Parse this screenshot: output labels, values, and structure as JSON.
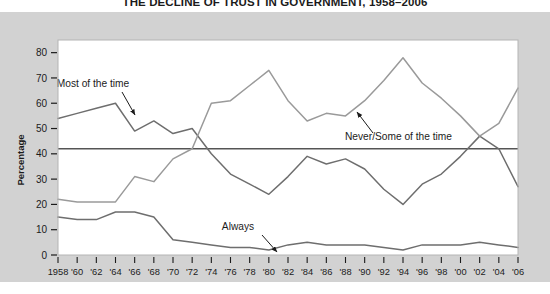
{
  "chart_data": {
    "type": "line",
    "title": "THE DECLINE OF TRUST IN GOVERNMENT, 1958–2006",
    "xlabel": "",
    "ylabel": "Percentage",
    "ylim": [
      0,
      85
    ],
    "yticks": [
      0,
      10,
      20,
      30,
      40,
      50,
      60,
      70,
      80
    ],
    "ytick_labels": [
      "0",
      "10",
      "20",
      "30",
      "40",
      "50",
      "60",
      "70",
      "80"
    ],
    "grid": false,
    "legend_position": "inline-annotations",
    "x": [
      1958,
      1960,
      1962,
      1964,
      1966,
      1968,
      1970,
      1972,
      1974,
      1976,
      1978,
      1980,
      1982,
      1984,
      1986,
      1988,
      1990,
      1992,
      1994,
      1996,
      1998,
      2000,
      2002,
      2004,
      2006
    ],
    "xtick_labels": [
      "1958",
      "'60",
      "'62",
      "'64",
      "'66",
      "'68",
      "'70",
      "'72",
      "'74",
      "'76",
      "'78",
      "'80",
      "'82",
      "'84",
      "'86",
      "'88",
      "'90",
      "'92",
      "'94",
      "'96",
      "'98",
      "'00",
      "'02",
      "'04",
      "'06"
    ],
    "reference_line": {
      "value": 42,
      "orientation": "horizontal",
      "color": "#555555"
    },
    "series": [
      {
        "name": "Most of the time",
        "color": "#6e6e6e",
        "values": [
          54,
          56,
          58,
          60,
          49,
          53,
          48,
          50,
          40,
          32,
          28,
          24,
          31,
          39,
          36,
          38,
          34,
          26,
          20,
          28,
          32,
          39,
          47,
          42,
          27
        ]
      },
      {
        "name": "Never/Some of the time",
        "color": "#9a9a9a",
        "values": [
          22,
          21,
          21,
          21,
          31,
          29,
          38,
          42,
          60,
          61,
          67,
          73,
          61,
          53,
          56,
          55,
          61,
          69,
          78,
          68,
          62,
          55,
          47,
          52,
          66
        ]
      },
      {
        "name": "Always",
        "color": "#6e6e6e",
        "values": [
          15,
          14,
          14,
          17,
          17,
          15,
          6,
          5,
          4,
          3,
          3,
          2,
          4,
          5,
          4,
          4,
          4,
          3,
          2,
          4,
          4,
          4,
          5,
          4,
          3
        ]
      }
    ],
    "annotations": [
      {
        "label": "Most of the time",
        "text_x": 93,
        "text_y": 75,
        "arrow_from_x": 122,
        "arrow_from_y": 80,
        "arrow_to_x": 135,
        "arrow_to_y": 103
      },
      {
        "label": "Never/Some of the time",
        "text_x": 345,
        "text_y": 128,
        "arrow_from_x": 373,
        "arrow_from_y": 121,
        "arrow_to_x": 357,
        "arrow_to_y": 100
      },
      {
        "label": "Always",
        "text_x": 238,
        "text_y": 218,
        "arrow_from_x": 262,
        "arrow_from_y": 223,
        "arrow_to_x": 277,
        "arrow_to_y": 240
      }
    ]
  }
}
